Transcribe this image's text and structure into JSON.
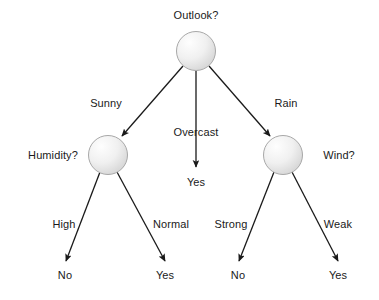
{
  "diagram": {
    "type": "decision-tree",
    "background_color": "#ffffff",
    "line_color": "#1a1a1a",
    "text_color": "#1a1a1a",
    "node_fill_light": "#fefefe",
    "node_fill_dark": "#d8d8d8",
    "node_stroke": "#a8a8a8",
    "nodes": [
      {
        "id": "root",
        "kind": "decision",
        "label": "Outlook?",
        "cx": 196,
        "cy": 51,
        "r": 19.5,
        "label_x": 196,
        "label_y": 9
      },
      {
        "id": "humidity",
        "kind": "decision",
        "label": "Humidity?",
        "cx": 108,
        "cy": 155,
        "r": 19.5,
        "label_x": 53,
        "label_y": 149
      },
      {
        "id": "wind",
        "kind": "decision",
        "label": "Wind?",
        "cx": 283,
        "cy": 155,
        "r": 19.5,
        "label_x": 339,
        "label_y": 149
      },
      {
        "id": "leaf-overcast-yes",
        "kind": "leaf",
        "label": "Yes",
        "label_x": 196,
        "label_y": 176
      },
      {
        "id": "leaf-high-no",
        "kind": "leaf",
        "label": "No",
        "label_x": 65,
        "label_y": 269
      },
      {
        "id": "leaf-normal-yes",
        "kind": "leaf",
        "label": "Yes",
        "label_x": 165,
        "label_y": 269
      },
      {
        "id": "leaf-strong-no",
        "kind": "leaf",
        "label": "No",
        "label_x": 238,
        "label_y": 269
      },
      {
        "id": "leaf-weak-yes",
        "kind": "leaf",
        "label": "Yes",
        "label_x": 338,
        "label_y": 269
      }
    ],
    "edges": [
      {
        "id": "root-sunny",
        "from": "root",
        "to": "humidity",
        "label": "Sunny",
        "label_x": 106,
        "label_y": 97,
        "x1": 183,
        "y1": 66,
        "x2": 122,
        "y2": 136
      },
      {
        "id": "root-overcast",
        "from": "root",
        "to": "leaf-overcast-yes",
        "label": "Overcast",
        "label_x": 196,
        "label_y": 126,
        "x1": 196,
        "y1": 71,
        "x2": 196,
        "y2": 167
      },
      {
        "id": "root-rain",
        "from": "root",
        "to": "wind",
        "label": "Rain",
        "label_x": 286,
        "label_y": 97,
        "x1": 209,
        "y1": 66,
        "x2": 270,
        "y2": 136
      },
      {
        "id": "humidity-high",
        "from": "humidity",
        "to": "leaf-high-no",
        "label": "High",
        "label_x": 64,
        "label_y": 218,
        "x1": 100,
        "y1": 172,
        "x2": 66,
        "y2": 261
      },
      {
        "id": "humidity-normal",
        "from": "humidity",
        "to": "leaf-normal-yes",
        "label": "Normal",
        "label_x": 171,
        "label_y": 218,
        "x1": 117,
        "y1": 172,
        "x2": 165,
        "y2": 261
      },
      {
        "id": "wind-strong",
        "from": "wind",
        "to": "leaf-strong-no",
        "label": "Strong",
        "label_x": 231,
        "label_y": 218,
        "x1": 274,
        "y1": 172,
        "x2": 239,
        "y2": 261
      },
      {
        "id": "wind-weak",
        "from": "wind",
        "to": "leaf-weak-yes",
        "label": "Weak",
        "label_x": 338,
        "label_y": 218,
        "x1": 292,
        "y1": 172,
        "x2": 338,
        "y2": 261
      }
    ]
  }
}
